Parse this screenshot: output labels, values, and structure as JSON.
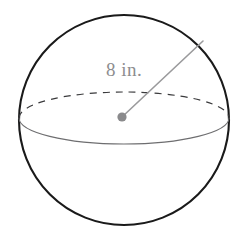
{
  "figure": {
    "name": "sphere-with-radius",
    "background_color": "#ffffff",
    "width": 247,
    "height": 249
  },
  "sphere": {
    "outline_color": "#1a1a1a",
    "outline_width": 2.1,
    "center_x": 124,
    "center_y": 120,
    "radius": 105
  },
  "equator": {
    "name": "equator-ellipse",
    "rx": 105,
    "ry": 26,
    "center_x": 124,
    "center_y": 118,
    "front_arc_color": "#6e6e70",
    "front_arc_width": 1.1,
    "back_arc_color": "#3a3a3c",
    "back_arc_width": 1.2,
    "back_arc_dash": "7 6"
  },
  "radius_line": {
    "name": "radius-segment",
    "color": "#9a9a9c",
    "width": 1.6,
    "start_x": 122,
    "start_y": 117,
    "end_x": 203,
    "end_y": 41
  },
  "center_point": {
    "name": "sphere-center-dot",
    "color": "#8a8a8c",
    "x": 122,
    "y": 117,
    "radius": 4.6
  },
  "labels": {
    "radius_measure": "8 in.",
    "radius_measure_color": "#8d8d8f",
    "radius_measure_font_size": 19
  }
}
